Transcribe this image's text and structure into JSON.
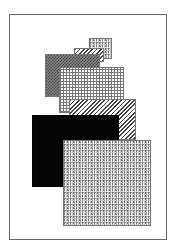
{
  "figure": {
    "frame": {
      "border_color": "#6a6a6a",
      "background": "#ffffff"
    },
    "shapes": [
      {
        "name": "small-speckle-rect",
        "pattern": "speckle",
        "x": 89,
        "y": 38,
        "w": 23,
        "h": 21
      },
      {
        "name": "small-hatch-rect",
        "pattern": "diagonal-hatch",
        "x": 74,
        "y": 48,
        "w": 30,
        "h": 14
      },
      {
        "name": "dark-checker-rect",
        "pattern": "dark-checker",
        "x": 45,
        "y": 54,
        "w": 55,
        "h": 43
      },
      {
        "name": "grid-rect",
        "pattern": "grid",
        "x": 59,
        "y": 67,
        "w": 65,
        "h": 46
      },
      {
        "name": "large-hatch-rect",
        "pattern": "diagonal-hatch",
        "x": 69,
        "y": 99,
        "w": 67,
        "h": 41
      },
      {
        "name": "black-rect",
        "pattern": "solid-black",
        "x": 32,
        "y": 115,
        "w": 87,
        "h": 72
      },
      {
        "name": "large-speckle-rect",
        "pattern": "speckle",
        "x": 63,
        "y": 140,
        "w": 88,
        "h": 86
      }
    ]
  }
}
